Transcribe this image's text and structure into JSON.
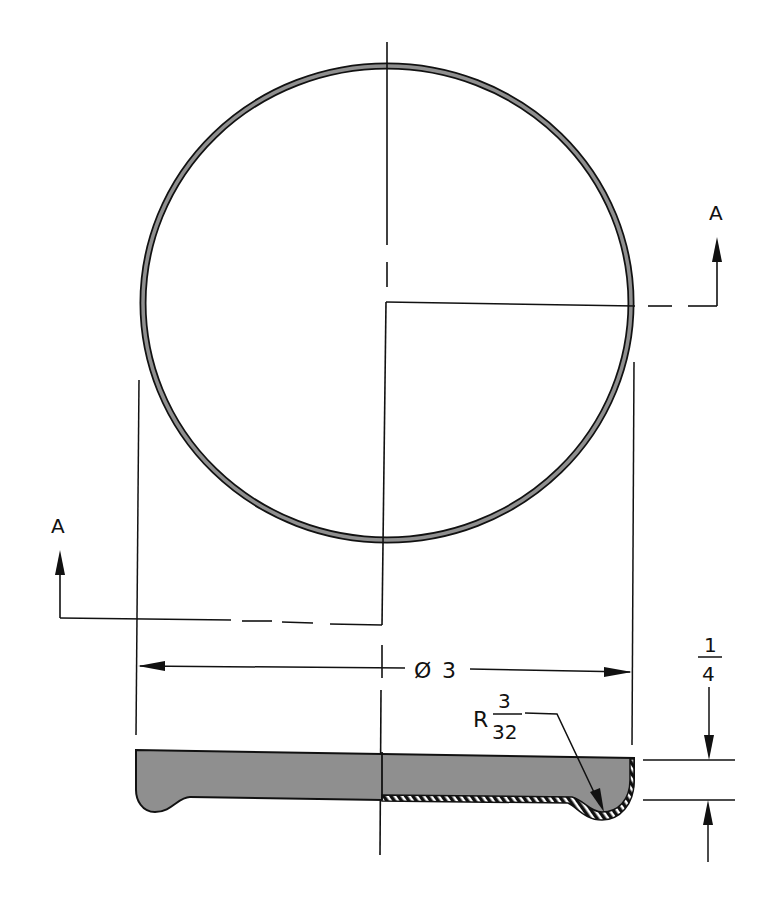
{
  "drawing": {
    "section_labels": {
      "top_right": "A",
      "bottom_left": "A"
    },
    "dimensions": {
      "diameter": {
        "symbol": "Ø",
        "value": "3"
      },
      "radius": {
        "prefix": "R",
        "numerator": "3",
        "denominator": "32"
      },
      "thickness": {
        "numerator": "1",
        "denominator": "4"
      }
    },
    "colors": {
      "line": "#111111",
      "fill": "#8f8f8f",
      "background": "#ffffff"
    }
  }
}
